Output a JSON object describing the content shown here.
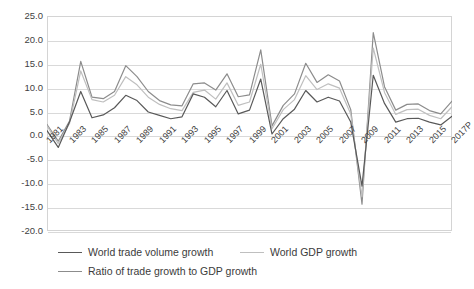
{
  "chart_data": {
    "type": "line",
    "title": "",
    "xlabel": "",
    "ylabel": "",
    "ylim": [
      -20.0,
      25.0
    ],
    "ytick_step": 5.0,
    "grid": true,
    "legend_position": "bottom",
    "ytick_labels": [
      "25.0",
      "20.0",
      "15.0",
      "10.0",
      "5.0",
      "0.0",
      "-5.0",
      "-10.0",
      "-15.0",
      "-20.0"
    ],
    "ytick_values": [
      25.0,
      20.0,
      15.0,
      10.0,
      5.0,
      0.0,
      -5.0,
      -10.0,
      -15.0,
      -20.0
    ],
    "x": [
      1981,
      1982,
      1983,
      1984,
      1985,
      1986,
      1987,
      1988,
      1989,
      1990,
      1991,
      1992,
      1993,
      1994,
      1995,
      1996,
      1997,
      1998,
      1999,
      2000,
      2001,
      2002,
      2003,
      2004,
      2005,
      2006,
      2007,
      2008,
      2009,
      2010,
      2011,
      2012,
      2013,
      2014,
      2015,
      2016,
      2017
    ],
    "xtick_labels": [
      "1981",
      "1983",
      "1985",
      "1987",
      "1989",
      "1991",
      "1993",
      "1995",
      "1997",
      "1999",
      "2001",
      "2003",
      "2005",
      "2007",
      "2009",
      "2011",
      "2013",
      "2015",
      "2017P"
    ],
    "series": [
      {
        "name": "World trade volume growth",
        "color": "#595959",
        "values": [
          1.0,
          -2.5,
          2.8,
          9.2,
          3.7,
          4.3,
          5.8,
          8.4,
          7.3,
          4.9,
          4.2,
          3.5,
          3.9,
          8.7,
          8.0,
          6.0,
          9.4,
          4.5,
          5.3,
          11.8,
          0.3,
          3.5,
          5.5,
          9.4,
          7.0,
          8.0,
          7.2,
          2.8,
          -10.6,
          12.6,
          6.7,
          2.8,
          3.5,
          3.6,
          2.8,
          2.2,
          4.0
        ]
      },
      {
        "name": "World GDP growth",
        "color": "#bfbfbf",
        "values": [
          2.0,
          -1.7,
          2.5,
          13.5,
          7.5,
          7.0,
          8.4,
          12.3,
          10.6,
          8.0,
          6.5,
          5.6,
          5.2,
          9.0,
          9.5,
          7.6,
          11.0,
          6.3,
          7.0,
          14.9,
          1.4,
          5.4,
          7.5,
          12.5,
          9.6,
          10.8,
          9.9,
          4.5,
          -12.8,
          18.3,
          9.0,
          4.4,
          5.4,
          5.5,
          4.2,
          3.5,
          6.0
        ]
      },
      {
        "name": "Ratio of trade growth to GDP growth",
        "color": "#8c8c8c",
        "values": [
          2.3,
          -1.2,
          3.0,
          15.5,
          8.0,
          7.7,
          9.2,
          14.6,
          12.3,
          9.2,
          7.3,
          6.4,
          6.2,
          10.8,
          11.0,
          9.5,
          12.9,
          8.1,
          8.5,
          17.9,
          2.0,
          6.3,
          8.7,
          15.1,
          11.1,
          12.7,
          11.4,
          5.4,
          -14.4,
          21.5,
          10.2,
          5.3,
          6.5,
          6.6,
          5.2,
          4.5,
          7.2
        ]
      }
    ]
  },
  "legend": {
    "items": [
      {
        "label": "World trade volume growth",
        "color": "#595959"
      },
      {
        "label": "World GDP growth",
        "color": "#bfbfbf"
      },
      {
        "label": "Ratio of trade growth to GDP growth",
        "color": "#8c8c8c"
      }
    ]
  }
}
